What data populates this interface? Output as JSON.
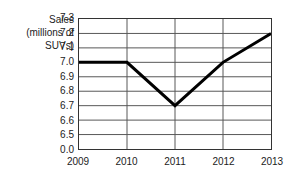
{
  "chart_data": {
    "type": "line",
    "title": "",
    "subtitle": "",
    "xlabel": "",
    "ylabel": "Sales (millions of SUVs)",
    "ylabel_lines": [
      "Sales",
      "(millions of",
      "SUVs)"
    ],
    "categories": [
      "2009",
      "2010",
      "2011",
      "2012",
      "2013"
    ],
    "x": [
      2009,
      2010,
      2011,
      2012,
      2013
    ],
    "values": [
      7.0,
      7.0,
      6.7,
      7.0,
      7.2
    ],
    "series": [
      {
        "name": "Sales",
        "values": [
          7.0,
          7.0,
          6.7,
          7.0,
          7.2
        ],
        "color": "#000000",
        "line_width": 3,
        "markers": false
      }
    ],
    "y_ticks": [
      "7.3",
      "7.2",
      "7.1",
      "7.0",
      "6.9",
      "6.8",
      "6.7",
      "6.6",
      "6.5",
      "0.0"
    ],
    "y_tick_values": [
      7.3,
      7.2,
      7.1,
      7.0,
      6.9,
      6.8,
      6.7,
      6.6,
      6.5,
      0.0
    ],
    "ylim": [
      6.4,
      7.3
    ],
    "y_axis_break": true,
    "y_axis_break_note": "axis broken below 6.5; bottom tick shown as 0.0",
    "grid": true,
    "grid_horizontal": true,
    "grid_vertical": true,
    "grid_color": "#555555",
    "legend": false,
    "legend_position": "none",
    "background_color": "#ffffff",
    "frame_color": "#333333",
    "annotations": []
  },
  "figure": {
    "y_caption": {
      "line1": "Sales",
      "line2": "(millions of",
      "line3": "SUVs)"
    }
  }
}
